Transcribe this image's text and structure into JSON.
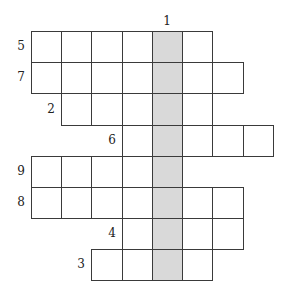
{
  "puzzle": {
    "type": "crossword",
    "shaded_column": 4,
    "shade_color": "#d9d9d9",
    "col_edges": [
      31,
      61,
      91,
      122,
      152,
      182,
      212,
      243,
      273
    ],
    "row_edges": [
      31,
      62,
      93,
      125,
      156,
      187,
      218,
      249,
      280
    ],
    "down_clue": {
      "number": "1",
      "col": 4
    },
    "rows": [
      {
        "number": "5",
        "start_col": 0,
        "end_col": 5
      },
      {
        "number": "7",
        "start_col": 0,
        "end_col": 6
      },
      {
        "number": "2",
        "start_col": 1,
        "end_col": 5
      },
      {
        "number": "6",
        "start_col": 3,
        "end_col": 7
      },
      {
        "number": "9",
        "start_col": 0,
        "end_col": 4
      },
      {
        "number": "8",
        "start_col": 0,
        "end_col": 6
      },
      {
        "number": "4",
        "start_col": 3,
        "end_col": 6
      },
      {
        "number": "3",
        "start_col": 2,
        "end_col": 5
      }
    ]
  }
}
